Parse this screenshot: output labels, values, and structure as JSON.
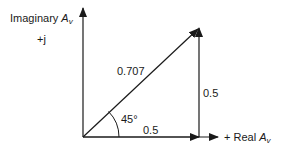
{
  "diagram": {
    "type": "phasor",
    "axes": {
      "imaginary_label": "Imaginary",
      "imaginary_symbol": "A",
      "imaginary_sub": "v",
      "imaginary_sign": "+j",
      "real_prefix": "+ Real",
      "real_symbol": "A",
      "real_sub": "v"
    },
    "vectors": {
      "resultant_magnitude": "0.707",
      "real_component": "0.5",
      "imaginary_component": "0.5",
      "angle": "45°"
    },
    "colors": {
      "line": "#1a1a1a",
      "background": "#ffffff"
    }
  }
}
